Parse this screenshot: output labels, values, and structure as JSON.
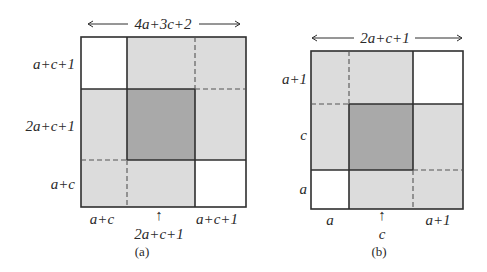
{
  "colors": {
    "light": "#dcdcdc",
    "dark": "#a9a9a9",
    "white": "#ffffff",
    "line": "#2f2f2f"
  },
  "figure_a": {
    "caption": "(a)",
    "width_label": "4a+3c+2",
    "row_labels": [
      "a+c+1",
      "2a+c+1",
      "a+c"
    ],
    "col_labels": [
      "a+c",
      "2a+c+1",
      "a+c+1"
    ],
    "arrow_up": "↑"
  },
  "figure_b": {
    "caption": "(b)",
    "width_label": "2a+c+1",
    "row_labels": [
      "a+1",
      "c",
      "a"
    ],
    "col_labels": [
      "a",
      "c",
      "a+1"
    ],
    "arrow_up": "↑"
  }
}
